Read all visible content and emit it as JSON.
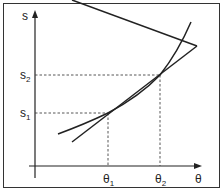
{
  "diagram": {
    "y_axis_label": "s",
    "x_axis_label": "θ",
    "y_ticks": [
      {
        "label": "s",
        "sub": "2"
      },
      {
        "label": "s",
        "sub": "1"
      }
    ],
    "x_ticks": [
      {
        "label": "θ",
        "sub": "1"
      },
      {
        "label": "θ",
        "sub": "2"
      }
    ],
    "curves": [
      "convex-curve",
      "secant-line"
    ],
    "colors": {
      "line": "#222222",
      "frame": "#333333",
      "background": "#ffffff"
    }
  }
}
